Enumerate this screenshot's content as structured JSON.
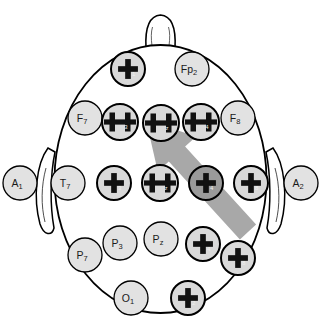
{
  "figure": {
    "view": "top-down head diagram, nose at top",
    "background_color": "#ffffff",
    "outline_color": "#000000",
    "electrode_fill": "#e2e2e2",
    "electrode_marked_fill": "#d9d9d9",
    "electrode_highlight_fill": "#9a9a9a",
    "marker_color": "#111111",
    "arrow_color": "#a8a8a8"
  },
  "arrow": {
    "name": "direction-arrow",
    "color": "#a8a8a8",
    "from": [
      248,
      232
    ],
    "to": [
      146,
      120
    ],
    "points_toward": "F3"
  },
  "head": {
    "nose_label": "nose",
    "left_ear_label": "left ear",
    "right_ear_label": "right ear"
  },
  "electrodes": [
    {
      "id": "Fp1",
      "base": "Fp",
      "sub": "1",
      "x": 128,
      "y": 69,
      "r": 17,
      "marked": true,
      "highlight": false,
      "show_label": false
    },
    {
      "id": "Fp2",
      "base": "Fp",
      "sub": "2",
      "x": 192,
      "y": 69,
      "r": 17,
      "marked": false,
      "highlight": false,
      "show_label": true
    },
    {
      "id": "F7",
      "base": "F",
      "sub": "7",
      "x": 85,
      "y": 118,
      "r": 17,
      "marked": false,
      "highlight": false,
      "show_label": true
    },
    {
      "id": "F3",
      "base": "F",
      "sub": "3",
      "x": 120,
      "y": 122,
      "r": 18,
      "marked": true,
      "highlight": false,
      "show_label": false
    },
    {
      "id": "Fz",
      "base": "F",
      "sub": "z",
      "x": 161,
      "y": 123,
      "r": 18,
      "marked": true,
      "highlight": false,
      "show_label": false
    },
    {
      "id": "F4",
      "base": "F",
      "sub": "4",
      "x": 201,
      "y": 122,
      "r": 18,
      "marked": true,
      "highlight": false,
      "show_label": false
    },
    {
      "id": "F8",
      "base": "F",
      "sub": "8",
      "x": 238,
      "y": 118,
      "r": 17,
      "marked": false,
      "highlight": false,
      "show_label": true
    },
    {
      "id": "A1",
      "base": "A",
      "sub": "1",
      "x": 20,
      "y": 183,
      "r": 17,
      "marked": false,
      "highlight": false,
      "show_label": true
    },
    {
      "id": "T7",
      "base": "T",
      "sub": "7",
      "x": 68,
      "y": 183,
      "r": 17,
      "marked": false,
      "highlight": false,
      "show_label": true
    },
    {
      "id": "C3",
      "base": "C",
      "sub": "3",
      "x": 114,
      "y": 183,
      "r": 17,
      "marked": true,
      "highlight": false,
      "show_label": false
    },
    {
      "id": "Cz",
      "base": "C",
      "sub": "z",
      "x": 160,
      "y": 183,
      "r": 18,
      "marked": true,
      "highlight": false,
      "show_label": false
    },
    {
      "id": "C4",
      "base": "C",
      "sub": "4",
      "x": 206,
      "y": 183,
      "r": 17,
      "marked": true,
      "highlight": true,
      "show_label": false
    },
    {
      "id": "T8",
      "base": "T",
      "sub": "8",
      "x": 251,
      "y": 183,
      "r": 17,
      "marked": true,
      "highlight": false,
      "show_label": false
    },
    {
      "id": "A2",
      "base": "A",
      "sub": "2",
      "x": 301,
      "y": 183,
      "r": 17,
      "marked": false,
      "highlight": false,
      "show_label": true
    },
    {
      "id": "P7",
      "base": "P",
      "sub": "7",
      "x": 85,
      "y": 255,
      "r": 17,
      "marked": false,
      "highlight": false,
      "show_label": true
    },
    {
      "id": "P3",
      "base": "P",
      "sub": "3",
      "x": 120,
      "y": 243,
      "r": 17,
      "marked": false,
      "highlight": false,
      "show_label": true
    },
    {
      "id": "Pz",
      "base": "P",
      "sub": "z",
      "x": 161,
      "y": 239,
      "r": 17,
      "marked": false,
      "highlight": false,
      "show_label": true
    },
    {
      "id": "P4",
      "base": "P",
      "sub": "4",
      "x": 203,
      "y": 244,
      "r": 17,
      "marked": true,
      "highlight": false,
      "show_label": false
    },
    {
      "id": "P8",
      "base": "P",
      "sub": "8",
      "x": 238,
      "y": 258,
      "r": 17,
      "marked": true,
      "highlight": false,
      "show_label": false
    },
    {
      "id": "O1",
      "base": "O",
      "sub": "1",
      "x": 131,
      "y": 298,
      "r": 17,
      "marked": false,
      "highlight": false,
      "show_label": true
    },
    {
      "id": "O2",
      "base": "O",
      "sub": "2",
      "x": 188,
      "y": 298,
      "r": 17,
      "marked": true,
      "highlight": false,
      "show_label": false
    }
  ],
  "caption": {
    "text": ""
  }
}
